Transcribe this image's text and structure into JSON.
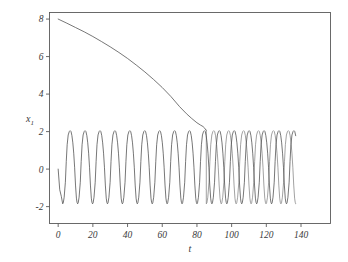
{
  "chart_data": {
    "type": "line",
    "title": "",
    "subtitle": "",
    "xlabel": "t",
    "ylabel": "x",
    "ylabel_subscript": "1",
    "xlim": [
      -5,
      157
    ],
    "ylim": [
      -2.9,
      8.35
    ],
    "xticks": [
      0,
      20,
      40,
      60,
      80,
      100,
      120,
      140
    ],
    "xticklabels": [
      "0",
      "20",
      "40",
      "60",
      "80",
      "100",
      "120",
      "140"
    ],
    "yticks": [
      -2,
      0,
      2,
      4,
      6,
      8
    ],
    "yticklabels": [
      "-2",
      "0",
      "2",
      "4",
      "6",
      "8"
    ],
    "grid": false,
    "legend": null,
    "legend_position": "none",
    "frame": "full-box",
    "line_color": "#4a4a4a",
    "background_color": "#ffffff",
    "annotations": [
      "Slow decaying branch descends from x1 = 8 at t = 0 and merges with the oscillation near t = 85",
      "Fast relaxation oscillation spans roughly x1 = -1.85 to x1 = 2.05 across t = 0 to t = 137",
      "After the merge the oscillating trace appears doubled (two nearly coincident passes)"
    ],
    "series": [
      {
        "name": "slow decaying branch",
        "comment": "x1 falls from 8 toward 2, steepening before merging into the oscillation",
        "x": [
          0,
          5,
          10,
          15,
          20,
          25,
          30,
          35,
          40,
          45,
          50,
          55,
          60,
          65,
          70,
          74,
          77,
          80,
          82,
          83.5,
          84.5,
          85.2
        ],
        "y": [
          8.0,
          7.78,
          7.55,
          7.32,
          7.07,
          6.8,
          6.52,
          6.22,
          5.9,
          5.55,
          5.18,
          4.78,
          4.35,
          3.87,
          3.33,
          2.95,
          2.7,
          2.47,
          2.35,
          2.27,
          2.18,
          2.08
        ]
      },
      {
        "name": "relaxation oscillation",
        "comment": "fast limit-cycle spikes; peak near 2.05, trough near -1.85, period about 8.6 time units, running from t = 0 to t = 137",
        "t_start": 0,
        "t_end": 137.2,
        "period": 8.6,
        "peak": 2.05,
        "trough": -1.85,
        "start_value": 0.0,
        "n_cycles": 16
      }
    ]
  }
}
